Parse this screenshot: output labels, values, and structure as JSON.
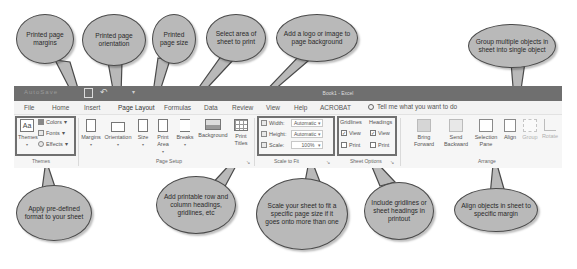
{
  "window": {
    "title": "Book1 - Excel",
    "qat_autosave": "AutoSave",
    "undo_icon": "↶"
  },
  "tabs": [
    {
      "label": "File"
    },
    {
      "label": "Home"
    },
    {
      "label": "Insert"
    },
    {
      "label": "Page Layout",
      "active": true
    },
    {
      "label": "Formulas"
    },
    {
      "label": "Data"
    },
    {
      "label": "Review"
    },
    {
      "label": "View"
    },
    {
      "label": "Help"
    },
    {
      "label": "ACROBAT"
    }
  ],
  "tell_me": "Tell me what you want to do",
  "ribbon": {
    "themes": {
      "group_label": "Themes",
      "themes_button": "Themes",
      "colors": "Colors",
      "fonts": "Fonts",
      "effects": "Effects"
    },
    "page_setup": {
      "group_label": "Page Setup",
      "buttons": [
        {
          "label": "Margins"
        },
        {
          "label": "Orientation"
        },
        {
          "label": "Size"
        },
        {
          "label": "Print Area"
        },
        {
          "label": "Breaks"
        },
        {
          "label": "Background"
        },
        {
          "label": "Print Titles"
        }
      ]
    },
    "scale_to_fit": {
      "group_label": "Scale to Fit",
      "width_label": "Width:",
      "width_value": "Automatic",
      "height_label": "Height:",
      "height_value": "Automatic",
      "scale_label": "Scale:",
      "scale_value": "100%"
    },
    "sheet_options": {
      "group_label": "Sheet Options",
      "gridlines": "Gridlines",
      "headings": "Headings",
      "view": "View",
      "print": "Print",
      "gridlines_view_checked": true,
      "gridlines_print_checked": false,
      "headings_view_checked": true,
      "headings_print_checked": false
    },
    "arrange": {
      "group_label": "Arrange",
      "buttons": [
        {
          "label": "Bring Forward"
        },
        {
          "label": "Send Backward"
        },
        {
          "label": "Selection Pane"
        },
        {
          "label": "Align"
        },
        {
          "label": "Group"
        },
        {
          "label": "Rotate"
        }
      ]
    }
  },
  "callouts": {
    "margins": "Printed page margins",
    "orientation": "Printed page orientation",
    "size": "Printed page size",
    "print_area": "Select area of sheet to print",
    "background": "Add a logo or image to page background",
    "group": "Group multiple objects in sheet into single object",
    "themes": "Apply pre-defined format to your sheet",
    "print_titles": "Add printable row and column headings, gridlines, etc",
    "scale": "Scale your sheet to fit a specific page size if it goes onto more than one",
    "sheet_options": "Include gridlines or sheet headings in printout",
    "align": "Align objects in sheet to specific margin"
  },
  "colors": {
    "titlebar": "#6f6f6f",
    "callout_fill": "#b9b9b9",
    "highlight_border": "#707070"
  }
}
